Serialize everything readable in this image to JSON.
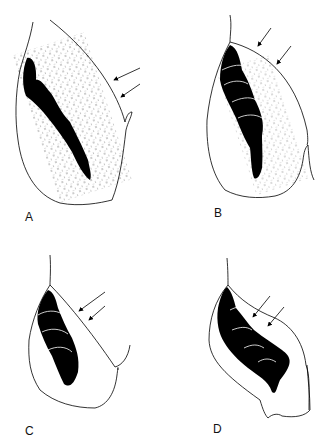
{
  "figure": {
    "panels": [
      {
        "id": "A",
        "label": "A"
      },
      {
        "id": "B",
        "label": "B"
      },
      {
        "id": "C",
        "label": "C"
      },
      {
        "id": "D",
        "label": "D"
      }
    ],
    "colors": {
      "ink": "#000000",
      "background": "#ffffff"
    }
  }
}
